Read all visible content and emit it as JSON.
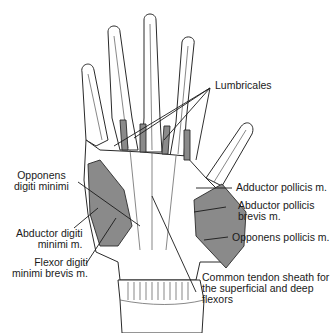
{
  "figure": {
    "colors": {
      "line": "#2a2a2a",
      "muscle_fill": "#8a8a8a",
      "bone_fill": "#ffffff",
      "background": "#ffffff"
    }
  },
  "labels": {
    "lumbricales": "Lumbricales",
    "opponens_digiti_minimi_1": "Opponens",
    "opponens_digiti_minimi_2": "digiti minimi",
    "adductor_pollicis": "Adductor pollicis m.",
    "abductor_digiti_minimi_1": "Abductor digiti",
    "abductor_digiti_minimi_2": "minimi m.",
    "abductor_pollicis_brevis_1": "Abductor pollicis",
    "abductor_pollicis_brevis_2": "brevis m.",
    "flexor_digiti_minimi_brevis_1": "Flexor digiti",
    "flexor_digiti_minimi_brevis_2": "minimi brevis m.",
    "opponens_pollicis": "Opponens pollicis m.",
    "common_tendon_sheath_1": "Common tendon sheath for",
    "common_tendon_sheath_2": "the superficial and deep",
    "common_tendon_sheath_3": "flexors"
  }
}
